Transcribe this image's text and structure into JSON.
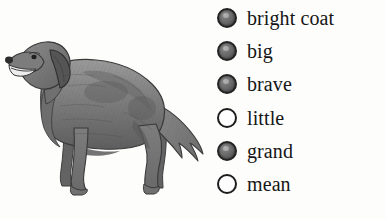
{
  "page": {
    "background_color": "#fdfdfb",
    "width": 386,
    "height": 219
  },
  "illustration": {
    "alt": "dog",
    "subject": "dog",
    "description": "grayscale pencil drawing of a long-haired retriever dog standing in profile facing left with open mouth and feathered tail",
    "style": "grayscale engraving",
    "ink_color": "#6b6b6b",
    "outline_color": "#3a3a3a"
  },
  "options": {
    "marker_fill_color": "#6a6a6a",
    "marker_outline_color": "#1c1c1c",
    "marker_empty_color": "#fefefe",
    "text_color": "#161616",
    "items": [
      {
        "label": "bright coat",
        "selected": true
      },
      {
        "label": "big",
        "selected": true
      },
      {
        "label": "brave",
        "selected": true
      },
      {
        "label": "little",
        "selected": false
      },
      {
        "label": "grand",
        "selected": true
      },
      {
        "label": "mean",
        "selected": false
      }
    ]
  }
}
